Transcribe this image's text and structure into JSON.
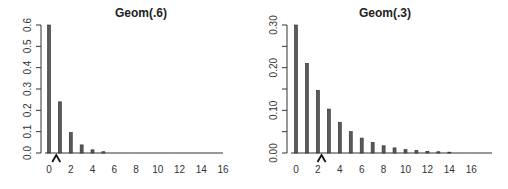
{
  "chart_data": [
    {
      "type": "bar",
      "title": "Geom(.6)",
      "xlabel": "",
      "ylabel": "",
      "categories": [
        0,
        1,
        2,
        3,
        4,
        5,
        6,
        7,
        8,
        9,
        10,
        11,
        12,
        13,
        14,
        15,
        16
      ],
      "values": [
        0.6,
        0.24,
        0.096,
        0.038,
        0.015,
        0.006,
        0.002,
        0.001,
        0.0004,
        0.0002,
        0.0001,
        0,
        0,
        0,
        0,
        0,
        0
      ],
      "ylim": [
        0,
        0.6
      ],
      "xlim": [
        0,
        16
      ],
      "yticks": [
        0.0,
        0.1,
        0.2,
        0.3,
        0.4,
        0.5,
        0.6
      ],
      "ytick_labels": [
        "0.0",
        "0.1",
        "0.2",
        "0.3",
        "0.4",
        "0.5",
        "0.6"
      ],
      "xticks": [
        0,
        2,
        4,
        6,
        8,
        10,
        12,
        14,
        16
      ],
      "xtick_labels": [
        "0",
        "2",
        "4",
        "6",
        "8",
        "10",
        "12",
        "14",
        "16"
      ],
      "mean_marker": 0.667,
      "grid": false,
      "legend": null
    },
    {
      "type": "bar",
      "title": "Geom(.3)",
      "xlabel": "",
      "ylabel": "",
      "categories": [
        0,
        1,
        2,
        3,
        4,
        5,
        6,
        7,
        8,
        9,
        10,
        11,
        12,
        13,
        14,
        15,
        16,
        17
      ],
      "values": [
        0.3,
        0.21,
        0.147,
        0.103,
        0.072,
        0.05,
        0.035,
        0.025,
        0.017,
        0.012,
        0.008,
        0.006,
        0.004,
        0.003,
        0.002,
        0.001,
        0.001,
        0.0007
      ],
      "ylim": [
        0,
        0.3
      ],
      "xlim": [
        0,
        17
      ],
      "yticks": [
        0.0,
        0.05,
        0.1,
        0.15,
        0.2,
        0.25,
        0.3
      ],
      "ytick_labels": [
        "0.00",
        "",
        "0.10",
        "",
        "0.20",
        "",
        "0.30"
      ],
      "xticks": [
        0,
        2,
        4,
        6,
        8,
        10,
        12,
        14,
        16
      ],
      "xtick_labels": [
        "0",
        "2",
        "4",
        "6",
        "8",
        "10",
        "12",
        "14",
        "16"
      ],
      "mean_marker": 2.333,
      "grid": false,
      "legend": null
    }
  ],
  "style": {
    "bar_fill": "#5a5a5a",
    "bar_stroke": "#2a2a2a",
    "axis_color": "#333333",
    "marker_color": "#111111"
  },
  "layout": [
    {
      "axis_x": 41,
      "x0": 49,
      "unit": 10.88,
      "y_top": 25,
      "y_base": 153,
      "baseline_end": 223,
      "title_x": 141
    },
    {
      "axis_x": 287,
      "x0": 296,
      "unit": 10.95,
      "y_top": 25,
      "y_base": 153,
      "baseline_end": 492,
      "title_x": 385
    }
  ]
}
